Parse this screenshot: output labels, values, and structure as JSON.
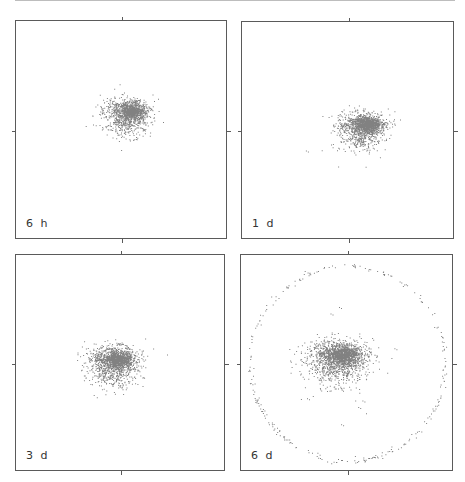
{
  "chart_data": {
    "type": "scatter",
    "title": "",
    "layout": "2x2 grid of scatter panels, no axis labels, center tick marks on each border",
    "grid": false,
    "legend": "none",
    "panels": [
      {
        "label": "6 h",
        "position": "top-left",
        "rect": [
          15,
          20,
          212,
          219
        ],
        "clusters": [
          {
            "cx": 0.52,
            "cy": 0.42,
            "rx": 0.1,
            "ry": 0.085,
            "n": 900,
            "shape": "half-dome"
          }
        ],
        "ring": null,
        "outliers": []
      },
      {
        "label": "1 d",
        "position": "top-right",
        "rect": [
          241,
          21,
          213,
          218
        ],
        "clusters": [
          {
            "cx": 0.56,
            "cy": 0.48,
            "rx": 0.1,
            "ry": 0.085,
            "n": 1000,
            "shape": "half-dome"
          }
        ],
        "ring": null,
        "outliers": [
          [
            0.3,
            0.59
          ]
        ]
      },
      {
        "label": "3 d",
        "position": "bottom-left",
        "rect": [
          15,
          254,
          210,
          217
        ],
        "clusters": [
          {
            "cx": 0.46,
            "cy": 0.49,
            "rx": 0.11,
            "ry": 0.09,
            "n": 1100,
            "shape": "half-dome"
          }
        ],
        "ring": null,
        "outliers": []
      },
      {
        "label": "6 d",
        "position": "bottom-right",
        "rect": [
          240,
          254,
          213,
          217
        ],
        "clusters": [
          {
            "cx": 0.45,
            "cy": 0.47,
            "rx": 0.13,
            "ry": 0.1,
            "n": 1300,
            "shape": "half-dome"
          }
        ],
        "ring": {
          "cx": 0.5,
          "cy": 0.5,
          "rx": 0.46,
          "ry": 0.45,
          "n": 260
        },
        "outliers": [
          [
            0.72,
            0.43
          ],
          [
            0.31,
            0.66
          ],
          [
            0.55,
            0.7
          ],
          [
            0.47,
            0.78
          ],
          [
            0.42,
            0.27
          ],
          [
            0.46,
            0.24
          ],
          [
            0.57,
            0.67
          ]
        ]
      }
    ],
    "point_color": "#1a1a1a",
    "frame_color": "#5a5a5a"
  }
}
